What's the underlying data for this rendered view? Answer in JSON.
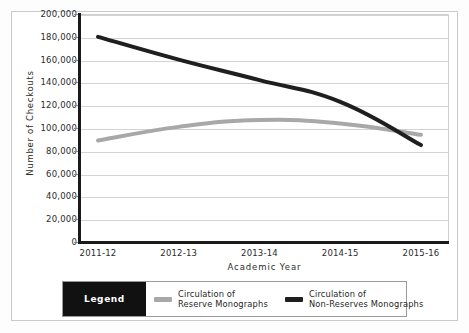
{
  "chart_data": {
    "type": "line",
    "title": "",
    "xlabel": "Academic Year",
    "ylabel": "Number of Checkouts",
    "categories": [
      "2011-12",
      "2012-13",
      "2013-14",
      "2014-15",
      "2015-16"
    ],
    "ylim": [
      0,
      200000
    ],
    "ytick_values": [
      0,
      20000,
      40000,
      60000,
      80000,
      100000,
      120000,
      140000,
      160000,
      180000,
      200000
    ],
    "ytick_labels": [
      "0",
      "20,000",
      "40,000",
      "60,000",
      "80,000",
      "100,000",
      "120,000",
      "140,000",
      "160,000",
      "180,000",
      "200,000"
    ],
    "grid": true,
    "legend_position": "bottom",
    "series": [
      {
        "name": "Circulation of Reserve Monographs",
        "color": "#a8a8a8",
        "values": [
          89000,
          101000,
          107000,
          104000,
          94000
        ]
      },
      {
        "name": "Circulation of Non-Reserves Monographs",
        "color": "#1f1f1f",
        "values": [
          180000,
          160000,
          142000,
          123000,
          85000
        ]
      }
    ]
  },
  "axes": {
    "y_title": "Number of Checkouts",
    "x_title": "Academic Year"
  },
  "legend": {
    "title": "Legend",
    "title_bg": "#111111",
    "title_fg": "#ffffff",
    "entries": [
      {
        "label": "Circulation of\nReserve Monographs",
        "color": "#a8a8a8"
      },
      {
        "label": "Circulation of\nNon-Reserves Monographs",
        "color": "#1f1f1f"
      }
    ]
  }
}
